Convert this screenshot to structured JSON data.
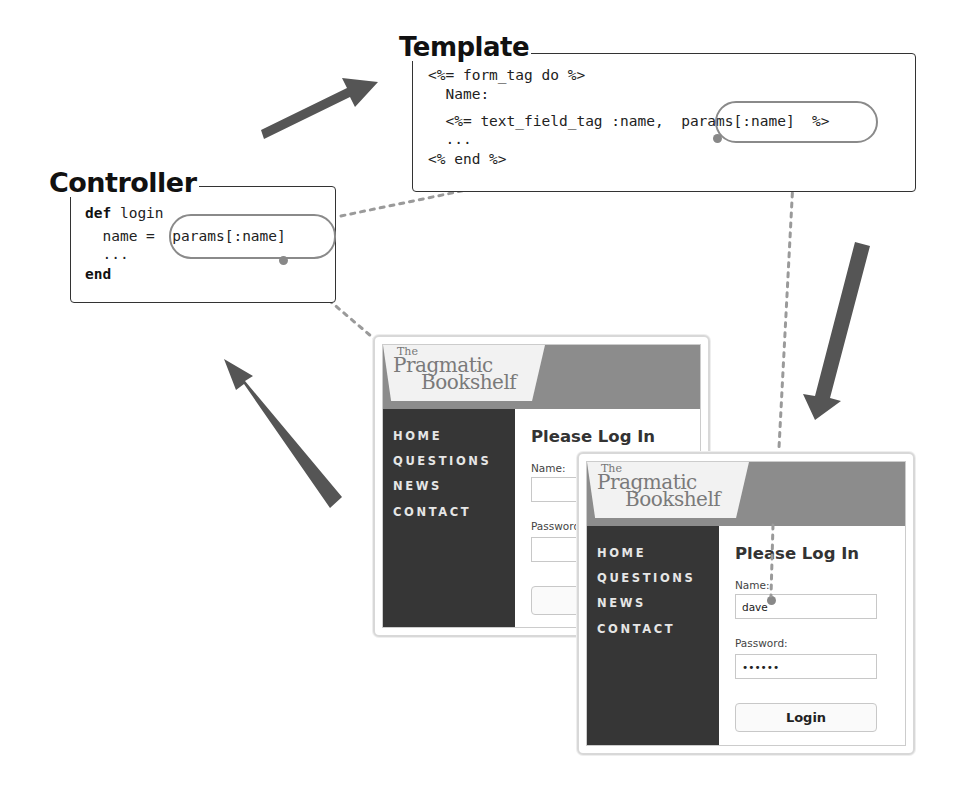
{
  "template": {
    "title": "Template",
    "lines": [
      "<%= form_tag do %>",
      "  Name:",
      "  <%= text_field_tag :name,  params[:name]  %>",
      "  ...",
      "<% end %>"
    ],
    "highlight": "params[:name]"
  },
  "controller": {
    "title": "Controller",
    "lines": [
      {
        "kw": "def",
        "text": " login"
      },
      {
        "kw": "",
        "text": "  name =  params[:name]"
      },
      {
        "kw": "",
        "text": "  ..."
      },
      {
        "kw": "end",
        "text": ""
      }
    ],
    "highlight": "params[:name]"
  },
  "browser_back": {
    "logo": {
      "the": "The",
      "line1": "Pragmatic",
      "line2": "Bookshelf"
    },
    "nav": [
      "HOME",
      "QUESTIONS",
      "NEWS",
      "CONTACT"
    ],
    "heading": "Please Log In",
    "name_label": "Name:",
    "name_value": "",
    "password_label": "Password:",
    "password_value": "",
    "button_label": ""
  },
  "browser_front": {
    "logo": {
      "the": "The",
      "line1": "Pragmatic",
      "line2": "Bookshelf"
    },
    "nav": [
      "HOME",
      "QUESTIONS",
      "NEWS",
      "CONTACT"
    ],
    "heading": "Please Log In",
    "name_label": "Name:",
    "name_value": "dave",
    "password_label": "Password:",
    "password_value": "••••••",
    "button_label": "Login"
  },
  "colors": {
    "arrow": "#555555",
    "connector": "#9a9a9a",
    "sidebar": "#363636",
    "header": "#8c8c8c"
  }
}
